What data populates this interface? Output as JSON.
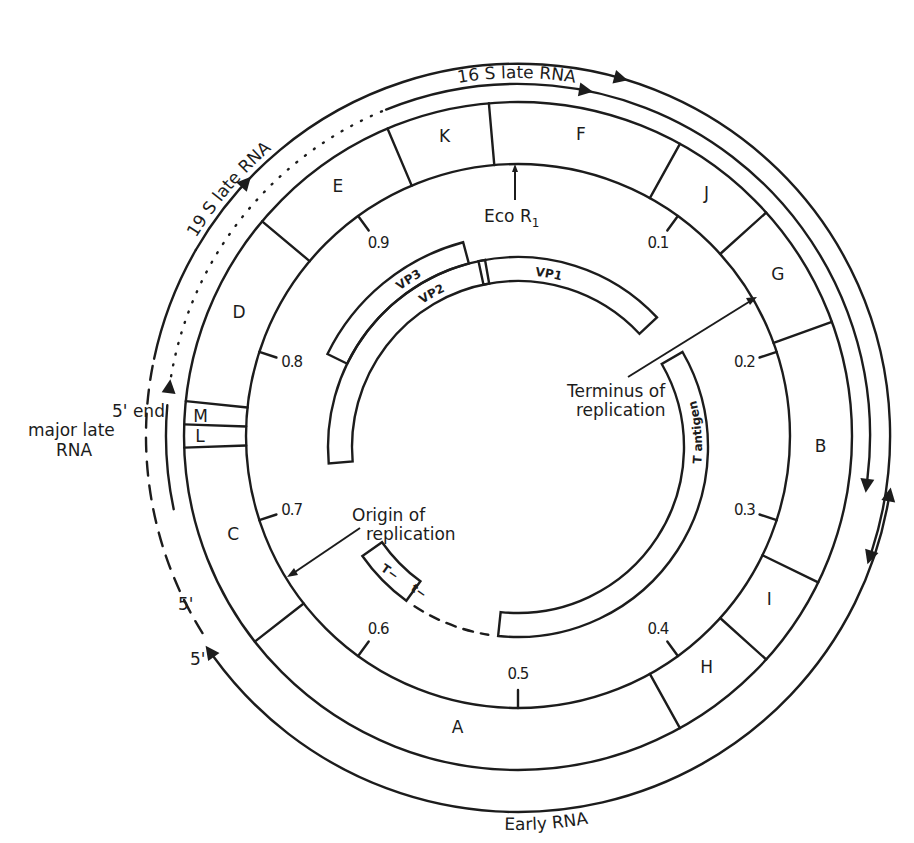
{
  "colors": {
    "ink": "#1c1c1c",
    "background": "#ffffff"
  },
  "geometry": {
    "center": [
      518,
      436
    ],
    "ring_inner_r": 272,
    "ring_outer_r": 334,
    "rna16_r": 352,
    "rna19_r": 372,
    "early_r": 356,
    "gene_center": [
      518,
      447
    ],
    "gene_inner_r": 166,
    "gene_outer_r": 190,
    "vp3_outer_r": 212
  },
  "restriction_fragments": [
    {
      "label": "F",
      "start": -5,
      "end": 29
    },
    {
      "label": "J",
      "start": 29,
      "end": 48
    },
    {
      "label": "G",
      "start": 48,
      "end": 70
    },
    {
      "label": "B",
      "start": 70,
      "end": 116
    },
    {
      "label": "I",
      "start": 116,
      "end": 132
    },
    {
      "label": "H",
      "start": 132,
      "end": 151
    },
    {
      "label": "A",
      "start": 151,
      "end": 232
    },
    {
      "label": "C",
      "start": 232,
      "end": 268
    },
    {
      "label": "L",
      "start": 268,
      "end": 272
    },
    {
      "label": "M",
      "start": 272,
      "end": 276
    },
    {
      "label": "D",
      "start": 276,
      "end": 310
    },
    {
      "label": "E",
      "start": 310,
      "end": 337
    },
    {
      "label": "K",
      "start": 337,
      "end": 355
    }
  ],
  "map_units": [
    {
      "label": "0.1",
      "angle": 36
    },
    {
      "label": "0.2",
      "angle": 72
    },
    {
      "label": "0.3",
      "angle": 108
    },
    {
      "label": "0.4",
      "angle": 144
    },
    {
      "label": "0.5",
      "angle": 180
    },
    {
      "label": "0.6",
      "angle": 216
    },
    {
      "label": "0.7",
      "angle": 252
    },
    {
      "label": "0.8",
      "angle": 288
    },
    {
      "label": "0.9",
      "angle": 324
    }
  ],
  "gene_products": [
    {
      "label": "VP1",
      "start": 348,
      "end": 47,
      "band": "inner"
    },
    {
      "label": "VP2",
      "start": 265,
      "end": 350,
      "band": "inner"
    },
    {
      "label": "VP3",
      "start": 296,
      "end": 345,
      "band": "outer"
    },
    {
      "label": "T antigen",
      "start": 60,
      "end": 186,
      "band": "inner"
    },
    {
      "label": "t",
      "start": 216,
      "end": 235,
      "band": "inner"
    }
  ],
  "annotations": {
    "eco_r1": "Eco R",
    "eco_r1_sub": "1",
    "terminus_line1": "Terminus of",
    "terminus_line2": "replication",
    "origin_line1": "Origin of",
    "origin_line2": "replication",
    "t_big": "T−",
    "t_small": "t−",
    "five_end_line1": "5' end",
    "five_end_line2": "major late",
    "five_end_line3": "RNA",
    "five_prime_a": "5'",
    "five_prime_b": "5'"
  },
  "transcripts": {
    "late19s": "19 S    late RNA",
    "late16s": "16 S late RNA",
    "early": "Early RNA"
  }
}
